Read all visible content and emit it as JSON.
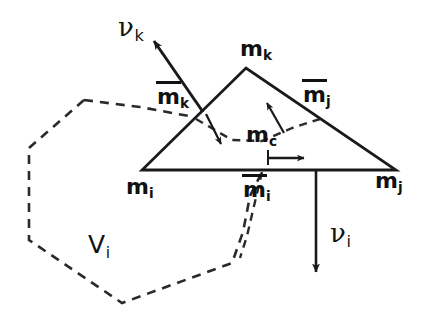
{
  "figure": {
    "background_color": "#ffffff",
    "stroke_color": "#1a1a1a",
    "width": 428,
    "height": 321
  },
  "labels": {
    "vertex_i": {
      "base": "m",
      "sub": "i"
    },
    "vertex_j": {
      "base": "m",
      "sub": "j"
    },
    "vertex_k": {
      "base": "m",
      "sub": "k"
    },
    "midpoint_i": {
      "base": "m",
      "sub": "i",
      "overbar": true
    },
    "midpoint_j": {
      "base": "m",
      "sub": "j",
      "overbar": true
    },
    "midpoint_k": {
      "base": "m",
      "sub": "k",
      "overbar": true
    },
    "centroid": {
      "base": "m",
      "sub": "c"
    },
    "normal_i": {
      "base": "ν",
      "sub": "i"
    },
    "normal_k": {
      "base": "ν",
      "sub": "k"
    },
    "control_volume": {
      "base": "V",
      "sub": "i"
    }
  },
  "geometry": {
    "triangle": {
      "vertex_i": [
        142,
        170
      ],
      "vertex_j": [
        396,
        170
      ],
      "vertex_k": [
        246,
        68
      ]
    },
    "midpoints": {
      "edge_ik": [
        194,
        119
      ],
      "edge_jk": [
        321,
        119
      ],
      "edge_ij": [
        269,
        170
      ]
    },
    "centroid": [
      261,
      133
    ],
    "control_volume_polygon": [
      [
        84,
        100
      ],
      [
        29,
        148
      ],
      [
        29,
        240
      ],
      [
        122,
        303
      ],
      [
        232,
        263
      ],
      [
        243,
        232
      ],
      [
        250,
        196
      ],
      [
        262,
        172
      ]
    ],
    "arrow_normal_k": {
      "from": [
        203,
        112
      ],
      "to": [
        152,
        39
      ]
    },
    "arrow_normal_i": {
      "from": [
        316,
        170
      ],
      "to": [
        316,
        274
      ]
    },
    "arrow_centroid_right": {
      "from": [
        268,
        158
      ],
      "to": [
        306,
        158
      ]
    },
    "arrow_to_midpoint_jk": {
      "from": [
        283,
        132
      ],
      "to": [
        266,
        104
      ]
    },
    "arrow_from_midpoint_ik": {
      "from": [
        205,
        115
      ],
      "to": [
        222,
        143
      ]
    }
  },
  "scan_artifacts": {
    "note": "faint background text bleed-through from scanned page",
    "marks": [
      "",
      "",
      "",
      "",
      "",
      ""
    ]
  }
}
